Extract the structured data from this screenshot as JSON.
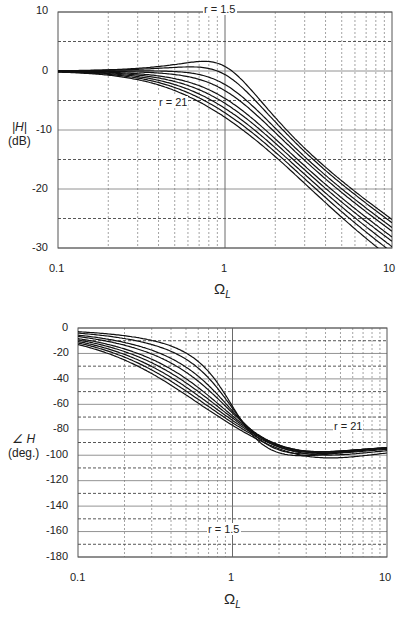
{
  "chart_data": [
    {
      "type": "line",
      "title": "",
      "xlabel": "Ω_L",
      "ylabel": "|H| (dB)",
      "xscale": "log",
      "xlim": [
        0.1,
        10
      ],
      "ylim": [
        -30,
        10
      ],
      "xticks": [
        "0.1",
        "1",
        "10"
      ],
      "yticks": [
        "10",
        "0",
        "-10",
        "-20",
        "-30"
      ],
      "grid": true,
      "annotations": [
        "r = 1.5",
        "r = 21"
      ],
      "series_param": "r",
      "series_r": [
        1.5,
        2,
        3,
        4,
        6,
        8,
        11,
        15,
        21
      ],
      "peak_db_approx": {
        "r=1.5": 7.5,
        "r=21": 0.5
      },
      "crossover": {
        "x": 2.0,
        "y": -7
      }
    },
    {
      "type": "line",
      "title": "",
      "xlabel": "Ω_L",
      "ylabel": "∠H (deg.)",
      "xscale": "log",
      "xlim": [
        0.1,
        10
      ],
      "ylim": [
        -180,
        0
      ],
      "xticks": [
        "0.1",
        "1",
        "10"
      ],
      "yticks": [
        "0",
        "-20",
        "-40",
        "-60",
        "-80",
        "-100",
        "-120",
        "-140",
        "-160",
        "-180"
      ],
      "grid": true,
      "annotations": [
        "r = 21",
        "r = 1.5"
      ],
      "series_param": "r",
      "series_r": [
        1.5,
        2,
        3,
        4,
        6,
        8,
        11,
        15,
        21
      ],
      "crossover": {
        "x": 0.8,
        "y": -45
      },
      "end_values_at_10": {
        "r=1.5": -177,
        "r=21": -112
      }
    }
  ],
  "top": {
    "y_title_1": "|H|",
    "y_title_2": "(dB)",
    "x_title": "Ω",
    "x_sub": "L",
    "ann_r_low": "r = 1.5",
    "ann_r_high": "r = 21",
    "yticks": [
      "10",
      "0",
      "-10",
      "-20",
      "-30"
    ],
    "xticks": [
      "0.1",
      "1",
      "10"
    ]
  },
  "bottom": {
    "y_title_1": "∠ H",
    "y_title_2": "(deg.)",
    "x_title": "Ω",
    "x_sub": "L",
    "ann_r_low": "r = 1.5",
    "ann_r_high": "r = 21",
    "yticks": [
      "0",
      "-20",
      "-40",
      "-60",
      "-80",
      "-100",
      "-120",
      "-140",
      "-160",
      "-180"
    ],
    "xticks": [
      "0.1",
      "1",
      "10"
    ]
  }
}
